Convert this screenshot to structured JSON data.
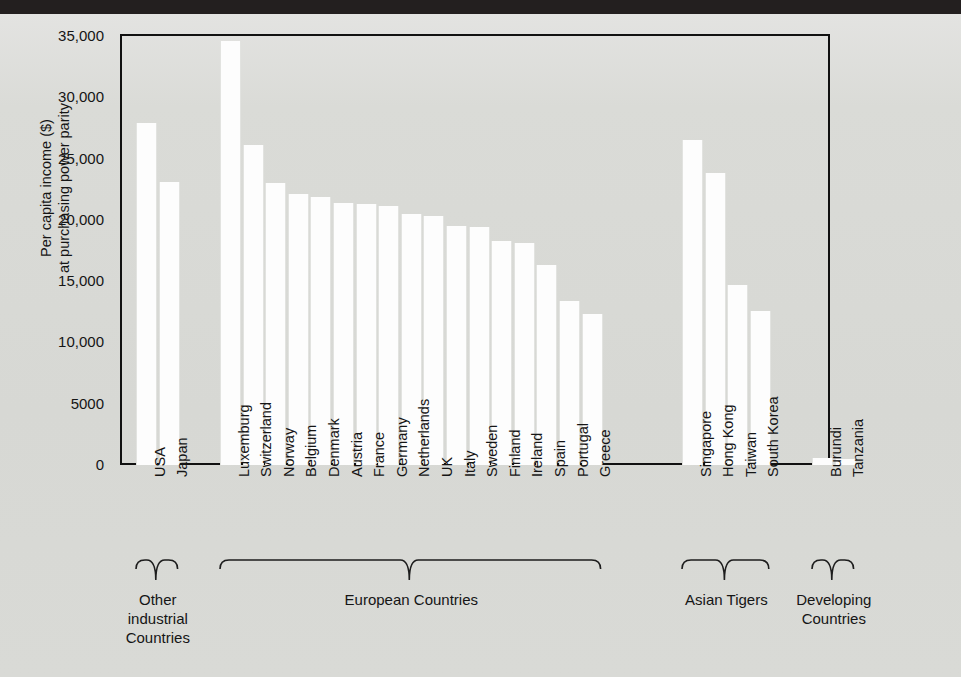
{
  "figure": {
    "background_color": "#d9dad6",
    "bar_color": "#fdfdfd",
    "frame_color": "#111111"
  },
  "chart_data": {
    "type": "bar",
    "title": "",
    "xlabel": "",
    "ylabel": "Per capita income ($) at purchasing power parity",
    "ylabel_line1": "Per capita income ($)",
    "ylabel_line2": "at purchasing power parity",
    "ylim": [
      0,
      35000
    ],
    "grid": false,
    "legend": "none",
    "ytick_labels": [
      "0",
      "5000",
      "10,000",
      "15,000",
      "20,000",
      "25,000",
      "30,000",
      "35,000"
    ],
    "ytick_values": [
      0,
      5000,
      10000,
      15000,
      20000,
      25000,
      30000,
      35000
    ],
    "categories": [
      "USA",
      "Japan",
      "Luxemburg",
      "Switzerland",
      "Norway",
      "Belgium",
      "Denmark",
      "Austria",
      "France",
      "Germany",
      "Netherlands",
      "UK",
      "Italy",
      "Sweden",
      "Finland",
      "Ireland",
      "Spain",
      "Portugal",
      "Greece",
      "Singapore",
      "Hong Kong",
      "Taiwan",
      "South Korea",
      "Burundi",
      "Tanzania"
    ],
    "values": [
      27900,
      23100,
      34600,
      26100,
      23000,
      22100,
      21900,
      21400,
      21300,
      21100,
      20500,
      20300,
      19500,
      19400,
      18300,
      18100,
      16300,
      13400,
      12300,
      26500,
      23800,
      14700,
      12600,
      600,
      500
    ],
    "groups": [
      {
        "label_lines": [
          "Other",
          "industrial",
          "Countries"
        ],
        "label": "Other industrial Countries",
        "members": [
          "USA",
          "Japan"
        ]
      },
      {
        "label_lines": [
          "European Countries"
        ],
        "label": "European Countries",
        "members": [
          "Luxemburg",
          "Switzerland",
          "Norway",
          "Belgium",
          "Denmark",
          "Austria",
          "France",
          "Germany",
          "Netherlands",
          "UK",
          "Italy",
          "Sweden",
          "Finland",
          "Ireland",
          "Spain",
          "Portugal",
          "Greece"
        ]
      },
      {
        "label_lines": [
          "Asian Tigers"
        ],
        "label": "Asian Tigers",
        "members": [
          "Singapore",
          "Hong Kong",
          "Taiwan",
          "South Korea"
        ]
      },
      {
        "label_lines": [
          "Developing",
          "Countries"
        ],
        "label": "Developing Countries",
        "members": [
          "Burundi",
          "Tanzania"
        ]
      }
    ]
  }
}
